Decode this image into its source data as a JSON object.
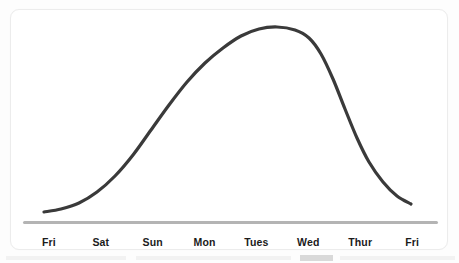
{
  "chart_data": {
    "type": "line",
    "title": "",
    "subtitle": "",
    "xlabel": "",
    "ylabel": "",
    "grid": false,
    "legend": false,
    "legend_position": "none",
    "smooth": true,
    "categories": [
      "Fri",
      "Sat",
      "Sun",
      "Mon",
      "Tues",
      "Wed",
      "Thur",
      "Fri"
    ],
    "x_tick_labels": [
      "Fri",
      "Sat",
      "Sun",
      "Mon",
      "Tues",
      "Wed",
      "Thur",
      "Fri"
    ],
    "values": [
      5,
      26,
      59,
      88,
      100,
      90,
      30,
      9
    ],
    "ylim": [
      0,
      110
    ],
    "y_axis_visible": false,
    "series": [
      {
        "name": "curve",
        "values": [
          5,
          26,
          59,
          88,
          100,
          90,
          30,
          9
        ],
        "color": "#3a3a3a",
        "line_width": 3
      }
    ],
    "path_points": [
      {
        "x": 33,
        "y": 202
      },
      {
        "x": 50,
        "y": 199
      },
      {
        "x": 68,
        "y": 193
      },
      {
        "x": 86,
        "y": 182
      },
      {
        "x": 104,
        "y": 166
      },
      {
        "x": 122,
        "y": 145
      },
      {
        "x": 140,
        "y": 120
      },
      {
        "x": 158,
        "y": 95
      },
      {
        "x": 176,
        "y": 72
      },
      {
        "x": 194,
        "y": 53
      },
      {
        "x": 212,
        "y": 38
      },
      {
        "x": 230,
        "y": 26
      },
      {
        "x": 248,
        "y": 19
      },
      {
        "x": 266,
        "y": 17
      },
      {
        "x": 284,
        "y": 20
      },
      {
        "x": 298,
        "y": 28
      },
      {
        "x": 310,
        "y": 44
      },
      {
        "x": 322,
        "y": 69
      },
      {
        "x": 334,
        "y": 99
      },
      {
        "x": 346,
        "y": 128
      },
      {
        "x": 358,
        "y": 152
      },
      {
        "x": 372,
        "y": 172
      },
      {
        "x": 386,
        "y": 186
      },
      {
        "x": 400,
        "y": 194
      }
    ],
    "axis_color": "#b4b4b4",
    "curve_color": "#3a3a3a",
    "background_color": "#ffffff"
  },
  "card": {
    "background_color": "#ffffff",
    "border_color": "#ececec"
  },
  "axis": {
    "line_name": "x-axis-line",
    "color": "#b4b4b4"
  }
}
